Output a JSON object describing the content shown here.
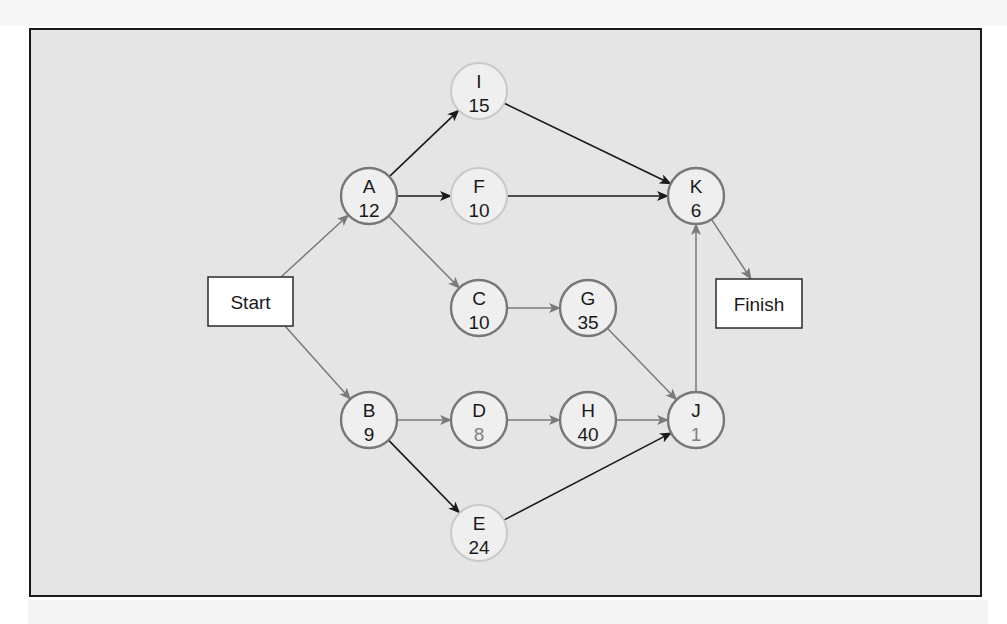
{
  "diagram": {
    "type": "activity-on-node network",
    "start": {
      "id": "start",
      "label": "Start",
      "x": 208,
      "y": 277,
      "w": 85,
      "h": 49
    },
    "finish": {
      "id": "finish",
      "label": "Finish",
      "x": 716,
      "y": 279,
      "w": 86,
      "h": 49
    },
    "colors": {
      "frame_fill": "#e5e5e5",
      "frame_border": "#1a1a1a",
      "node_fill": "#efefef",
      "node_outline_dark": "#777777",
      "node_outline_light": "#c9c9c9",
      "edge_gray": "#7a7a7a",
      "edge_black": "#1a1a1a",
      "text_dark": "#1a1a1a",
      "text_gray": "#808080"
    },
    "nodes": [
      {
        "id": "A",
        "label": "A",
        "duration": "12",
        "cx": 369,
        "cy": 196,
        "outline": "dark",
        "dur_color": "dark"
      },
      {
        "id": "I",
        "label": "I",
        "duration": "15",
        "cx": 479,
        "cy": 91,
        "outline": "light",
        "dur_color": "dark"
      },
      {
        "id": "F",
        "label": "F",
        "duration": "10",
        "cx": 479,
        "cy": 196,
        "outline": "light",
        "dur_color": "dark"
      },
      {
        "id": "C",
        "label": "C",
        "duration": "10",
        "cx": 479,
        "cy": 308,
        "outline": "dark",
        "dur_color": "dark"
      },
      {
        "id": "G",
        "label": "G",
        "duration": "35",
        "cx": 588,
        "cy": 308,
        "outline": "dark",
        "dur_color": "dark"
      },
      {
        "id": "K",
        "label": "K",
        "duration": "6",
        "cx": 696,
        "cy": 196,
        "outline": "dark",
        "dur_color": "dark"
      },
      {
        "id": "B",
        "label": "B",
        "duration": "9",
        "cx": 369,
        "cy": 420,
        "outline": "dark",
        "dur_color": "dark"
      },
      {
        "id": "D",
        "label": "D",
        "duration": "8",
        "cx": 479,
        "cy": 420,
        "outline": "dark",
        "dur_color": "gray"
      },
      {
        "id": "H",
        "label": "H",
        "duration": "40",
        "cx": 588,
        "cy": 420,
        "outline": "dark",
        "dur_color": "dark"
      },
      {
        "id": "J",
        "label": "J",
        "duration": "1",
        "cx": 696,
        "cy": 420,
        "outline": "dark",
        "dur_color": "gray"
      },
      {
        "id": "E",
        "label": "E",
        "duration": "24",
        "cx": 479,
        "cy": 533,
        "outline": "light",
        "dur_color": "dark"
      }
    ],
    "edges": [
      {
        "from": "Start",
        "to": "A",
        "color": "gray"
      },
      {
        "from": "Start",
        "to": "B",
        "color": "gray"
      },
      {
        "from": "A",
        "to": "I",
        "color": "black"
      },
      {
        "from": "A",
        "to": "F",
        "color": "black"
      },
      {
        "from": "A",
        "to": "C",
        "color": "gray"
      },
      {
        "from": "I",
        "to": "K",
        "color": "black"
      },
      {
        "from": "F",
        "to": "K",
        "color": "black"
      },
      {
        "from": "C",
        "to": "G",
        "color": "gray"
      },
      {
        "from": "G",
        "to": "J",
        "color": "gray"
      },
      {
        "from": "B",
        "to": "D",
        "color": "gray"
      },
      {
        "from": "B",
        "to": "E",
        "color": "black"
      },
      {
        "from": "D",
        "to": "H",
        "color": "gray"
      },
      {
        "from": "H",
        "to": "J",
        "color": "gray"
      },
      {
        "from": "E",
        "to": "J",
        "color": "black"
      },
      {
        "from": "J",
        "to": "K",
        "color": "gray"
      },
      {
        "from": "K",
        "to": "Finish",
        "color": "gray"
      }
    ]
  }
}
